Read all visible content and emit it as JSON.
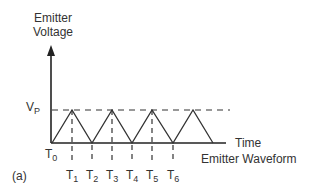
{
  "diagram": {
    "y_axis_label_line1": "Emitter",
    "y_axis_label_line2": "Voltage",
    "x_axis_label": "Time",
    "caption": "Emitter Waveform",
    "panel_label": "(a)",
    "peak_label": "V",
    "peak_label_sub": "P",
    "origin_label": "T",
    "origin_label_sub": "0",
    "time_marks": [
      {
        "base": "T",
        "sub": "1"
      },
      {
        "base": "T",
        "sub": "2"
      },
      {
        "base": "T",
        "sub": "3"
      },
      {
        "base": "T",
        "sub": "4"
      },
      {
        "base": "T",
        "sub": "5"
      },
      {
        "base": "T",
        "sub": "6"
      }
    ],
    "waveform": "triangle",
    "colors": {
      "line": "#333333",
      "text": "#333333"
    }
  }
}
